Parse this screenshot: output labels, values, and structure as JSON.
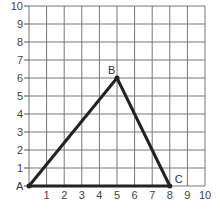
{
  "diagram": {
    "type": "coordinate-grid-triangle",
    "grid": {
      "x_min": 0,
      "x_max": 10,
      "y_min": 0,
      "y_max": 10,
      "x_ticks": [
        "1",
        "2",
        "3",
        "4",
        "5",
        "6",
        "7",
        "8",
        "9",
        "10"
      ],
      "y_ticks": [
        "1",
        "2",
        "3",
        "4",
        "5",
        "6",
        "7",
        "8",
        "9",
        "10"
      ],
      "line_color": "#777777",
      "axis_color": "#555555"
    },
    "points": [
      {
        "name": "A",
        "x": 0,
        "y": 0
      },
      {
        "name": "B",
        "x": 5,
        "y": 6
      },
      {
        "name": "C",
        "x": 8,
        "y": 0
      }
    ],
    "segments": [
      [
        "A",
        "B"
      ],
      [
        "B",
        "C"
      ],
      [
        "A",
        "C"
      ]
    ],
    "stroke_color": "#222222"
  }
}
